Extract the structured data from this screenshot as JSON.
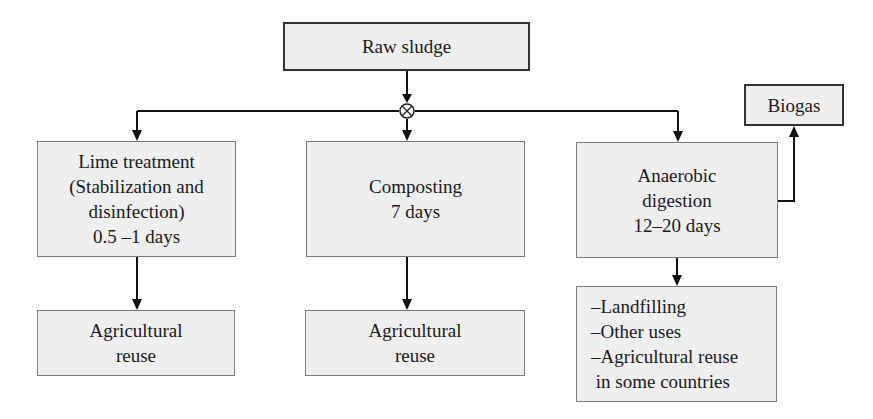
{
  "diagram": {
    "type": "flowchart",
    "source": {
      "label": "Raw sludge"
    },
    "junction": {
      "symbol": "⊗"
    },
    "branches": [
      {
        "process": {
          "lines": [
            "Lime treatment",
            "(Stabilization and",
            "disinfection)",
            "0.5 –1 days"
          ]
        },
        "output": {
          "lines": [
            "Agricultural",
            "reuse"
          ]
        }
      },
      {
        "process": {
          "lines": [
            "Composting",
            "7 days"
          ]
        },
        "output": {
          "lines": [
            "Agricultural",
            "reuse"
          ]
        }
      },
      {
        "process": {
          "lines": [
            "Anaerobic",
            "digestion",
            "12–20 days"
          ]
        },
        "output": {
          "lines": [
            "–Landfilling",
            "–Other uses",
            "–Agricultural reuse",
            " in some countries"
          ]
        },
        "byproduct": {
          "label": "Biogas"
        }
      }
    ]
  }
}
